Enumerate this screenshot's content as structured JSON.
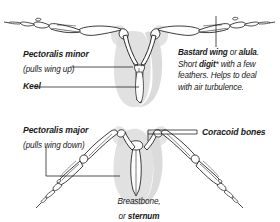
{
  "figure": {
    "background_color": "#ffffff",
    "ink_color": "#1a1a1a",
    "shade_color": "#d6d6d6",
    "bone_fill": "#fdfdfd"
  },
  "top_panel": {
    "left_label": {
      "line1": "Pectoralis minor",
      "line2": "(pulls wing up)"
    },
    "keel_label": "Keel",
    "right_note": {
      "line1_a": "Bastard wing",
      "line1_b": " or ",
      "line1_c": "alula",
      "line1_d": ".",
      "line2_a": "Short ",
      "line2_b": "digit",
      "line2_c": "* with a few",
      "line3": "feathers. Helps to deal",
      "line4": "with air turbulence."
    }
  },
  "bottom_panel": {
    "left_label": {
      "line1": "Pectoralis major",
      "line2": "(pulls wing down)"
    },
    "right_label": "Coracoid bones",
    "center_label": {
      "line1": "Breastbone,",
      "line2_a": "or ",
      "line2_b": "sternum"
    }
  }
}
